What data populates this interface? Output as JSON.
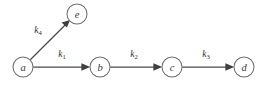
{
  "figure": {
    "background_color": "#ffffff",
    "width": 272,
    "height": 85
  },
  "style": {
    "node_stroke": "#6f6f6f",
    "node_fill": "#ffffff",
    "edge_color": "#4a4a4a",
    "arrowhead_color": "#3f3f3f",
    "label_color": "#2e2e2e",
    "node_label_color": "#3a3a3a"
  },
  "nodes": [
    {
      "id": "a",
      "label": "a",
      "cx": 23,
      "cy": 67,
      "r": 10
    },
    {
      "id": "e",
      "label": "e",
      "cx": 77,
      "cy": 14,
      "r": 10
    },
    {
      "id": "b",
      "label": "b",
      "cx": 100,
      "cy": 67,
      "r": 10
    },
    {
      "id": "c",
      "label": "c",
      "cx": 172,
      "cy": 67,
      "r": 10
    },
    {
      "id": "d",
      "label": "d",
      "cx": 244,
      "cy": 67,
      "r": 10
    }
  ],
  "edges": [
    {
      "id": "a-to-e",
      "from": "a",
      "to": "e",
      "rate": "k",
      "subscript": "4",
      "label_x": 38,
      "label_y": 33,
      "orientation": "diagonal"
    },
    {
      "id": "a-to-b",
      "from": "a",
      "to": "b",
      "rate": "k",
      "subscript": "1",
      "label_x": 62,
      "label_y": 57,
      "orientation": "horizontal"
    },
    {
      "id": "b-to-c",
      "from": "b",
      "to": "c",
      "rate": "k",
      "subscript": "2",
      "label_x": 134,
      "label_y": 57,
      "orientation": "horizontal"
    },
    {
      "id": "c-to-d",
      "from": "c",
      "to": "d",
      "rate": "k",
      "subscript": "3",
      "label_x": 206,
      "label_y": 57,
      "orientation": "horizontal"
    }
  ]
}
